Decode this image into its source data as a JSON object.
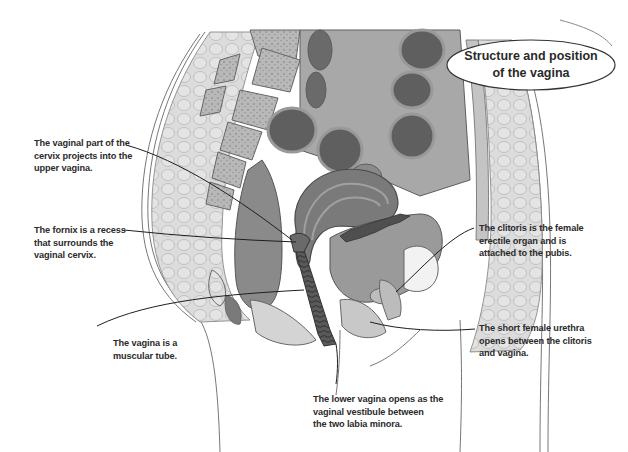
{
  "diagram": {
    "title": "Structure and position\nof the vagina",
    "style": {
      "background": "#ffffff",
      "text_color": "#2b2b2b",
      "outline_color": "#555555",
      "tissue_light": "#d9d9d9",
      "tissue_mid": "#a6a6a6",
      "tissue_dark": "#6e6e6e",
      "organ_darkest": "#4a4a4a"
    },
    "labels": [
      {
        "id": "vaginal-cervix",
        "text": "The vaginal part of the\ncervix projects into the\nupper vagina."
      },
      {
        "id": "fornix",
        "text": "The fornix is a recess\nthat surrounds the\nvaginal cervix."
      },
      {
        "id": "muscular-tube",
        "text": "The vagina is a\nmuscular tube."
      },
      {
        "id": "clitoris",
        "text": "The clitoris is the female\nerectile organ and is\nattached to the pubis."
      },
      {
        "id": "urethra",
        "text": "The short female urethra\nopens between the clitoris\nand vagina."
      },
      {
        "id": "vestibule",
        "text": "The lower vagina opens as the\nvaginal vestibule between\nthe two labia minora."
      }
    ]
  }
}
